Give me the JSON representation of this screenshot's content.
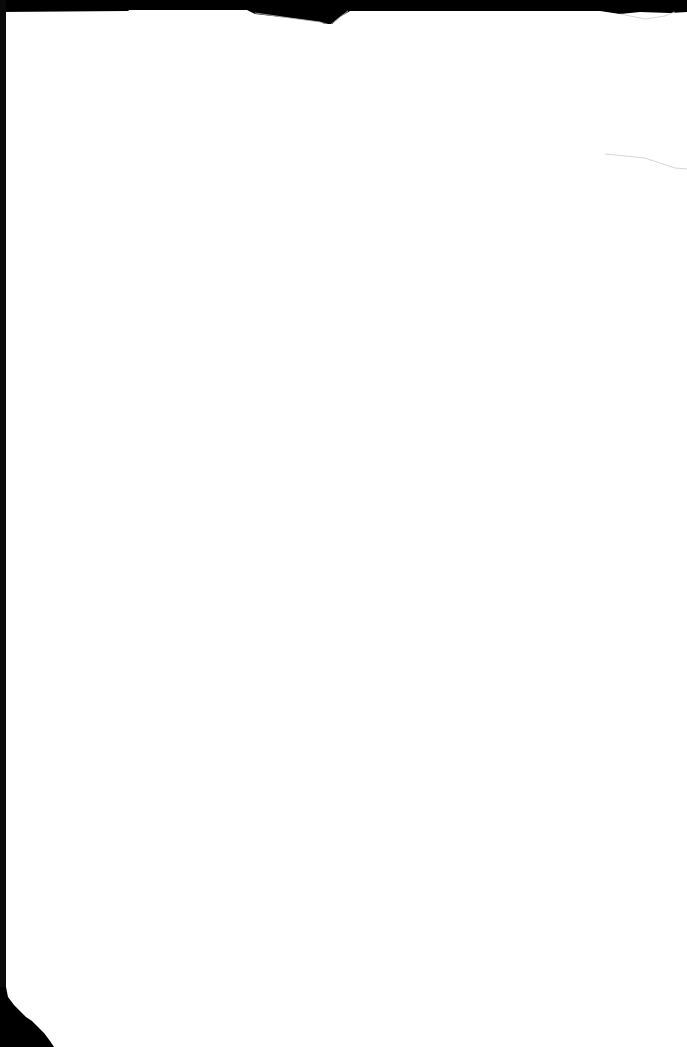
{
  "document": {
    "type": "scanned-page",
    "content": "",
    "is_blank": true
  },
  "colors": {
    "paper": "#ffffff",
    "scan_border": "#000000"
  }
}
